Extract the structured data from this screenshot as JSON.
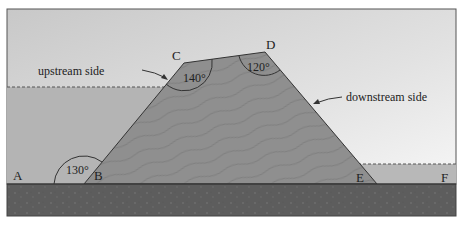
{
  "diagram": {
    "type": "dam cross-section",
    "points": {
      "A": {
        "label": "A",
        "x": 18,
        "y": 178
      },
      "B": {
        "label": "B",
        "x": 97,
        "y": 178
      },
      "C": {
        "label": "C",
        "x": 177,
        "y": 60
      },
      "D": {
        "label": "D",
        "x": 271,
        "y": 50
      },
      "E": {
        "label": "E",
        "x": 360,
        "y": 183
      },
      "F": {
        "label": "F",
        "x": 447,
        "y": 183
      }
    },
    "angles": [
      {
        "vertex": "B",
        "label": "130°",
        "x": 67,
        "y": 172
      },
      {
        "vertex": "C",
        "label": "140°",
        "x": 196,
        "y": 82
      },
      {
        "vertex": "D",
        "label": "120°",
        "x": 258,
        "y": 68
      }
    ],
    "annotations": [
      {
        "text": "upstream side",
        "x": 38,
        "y": 74,
        "anchor": "start",
        "arrow_to": [
          164,
          78
        ]
      },
      {
        "text": "downstream side",
        "x": 346,
        "y": 101,
        "anchor": "start",
        "arrow_to": [
          315,
          103
        ]
      }
    ],
    "colors": {
      "sky_top": "#c9c9c9",
      "sky_bottom": "#f3f3f3",
      "water": "#b4b4b4",
      "dam": "#8e8e8e",
      "ground": "#5e5e5e",
      "line": "#333333"
    }
  }
}
